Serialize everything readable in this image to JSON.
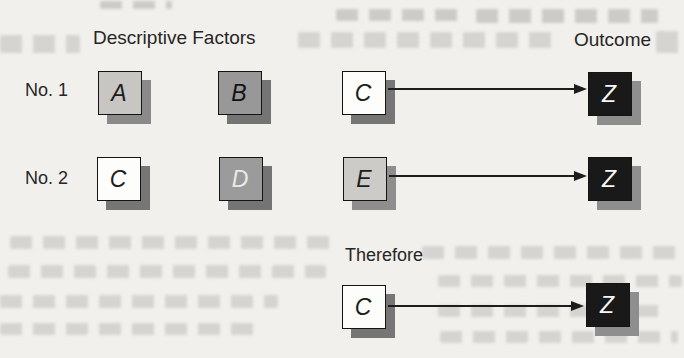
{
  "page": {
    "background": "#f2f0ed",
    "ink": "#1d1d1d"
  },
  "headers": {
    "factors": "Descriptive Factors",
    "outcome": "Outcome"
  },
  "rows": [
    {
      "label": "No. 1",
      "factors": [
        {
          "letter": "A",
          "fill": "#c7c6c3",
          "letter_color": "#1d1d1d",
          "shadow": "#8a8a8a"
        },
        {
          "letter": "B",
          "fill": "#989898",
          "letter_color": "#141414",
          "shadow": "#747474"
        },
        {
          "letter": "C",
          "fill": "#fdfdfb",
          "letter_color": "#1d1d1d",
          "shadow": "#767676"
        }
      ],
      "outcome": {
        "letter": "Z",
        "fill": "#191919",
        "letter_color": "#f7f7f7",
        "shadow": "#8e8e8e"
      }
    },
    {
      "label": "No. 2",
      "factors": [
        {
          "letter": "C",
          "fill": "#fdfdfb",
          "letter_color": "#1d1d1d",
          "shadow": "#767676"
        },
        {
          "letter": "D",
          "fill": "#9b9b9b",
          "letter_color": "#eceae6",
          "shadow": "#747474"
        },
        {
          "letter": "E",
          "fill": "#cccbc7",
          "letter_color": "#1d1d1d",
          "shadow": "#8e8e8e"
        }
      ],
      "outcome": {
        "letter": "Z",
        "fill": "#191919",
        "letter_color": "#f7f7f7",
        "shadow": "#8e8e8e"
      }
    },
    {
      "label": "Therefore",
      "factors": [
        {
          "letter": "C",
          "fill": "#fdfdfb",
          "letter_color": "#1d1d1d",
          "shadow": "#767676"
        }
      ],
      "outcome": {
        "letter": "Z",
        "fill": "#191919",
        "letter_color": "#f7f7f7",
        "shadow": "#8e8e8e"
      }
    }
  ]
}
